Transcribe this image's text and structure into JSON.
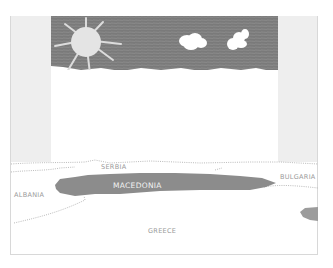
{
  "figure": {
    "type": "map with overlaid drawing",
    "drawing": {
      "elements": [
        "sun",
        "cloud",
        "cloud",
        "sky"
      ],
      "colors": {
        "sky": "#7a7a7a",
        "sun": "#e4e4e4",
        "cloud": "#ffffff"
      }
    },
    "map": {
      "highlighted_country": "MACEDONIA",
      "highlight_color": "#8c8c8c",
      "labels": {
        "serbia": "SERBIA",
        "albania": "ALBANIA",
        "macedonia": "MACEDONIA",
        "bulgaria": "BULGARIA",
        "greece": "GREECE"
      }
    }
  }
}
